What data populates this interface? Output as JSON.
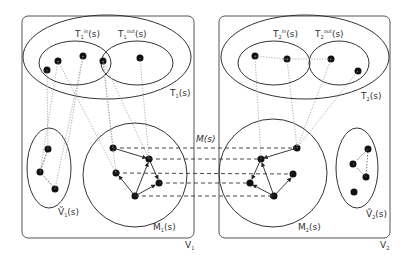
{
  "diagram": {
    "graphs": [
      {
        "id": "V1",
        "label": "V",
        "label_sub": "1",
        "regions": {
          "terminal": {
            "label": "T",
            "label_sub": "1",
            "label_suffix": "(s)"
          },
          "terminal_in": {
            "label": "T",
            "label_sub": "1",
            "label_sup": "in",
            "label_suffix": "(s)"
          },
          "terminal_out": {
            "label": "T",
            "label_sub": "1",
            "label_sup": "out",
            "label_suffix": "(s)"
          },
          "matched": {
            "label": "M",
            "label_sub": "1",
            "label_suffix": "(s)"
          },
          "remaining": {
            "label": "V",
            "label_sub": "1",
            "label_suffix": "(s)",
            "accent": "~"
          }
        }
      },
      {
        "id": "V2",
        "label": "V",
        "label_sub": "2",
        "regions": {
          "terminal": {
            "label": "T",
            "label_sub": "2",
            "label_suffix": "(s)"
          },
          "terminal_in": {
            "label": "T",
            "label_sub": "2",
            "label_sup": "in",
            "label_suffix": "(s)"
          },
          "terminal_out": {
            "label": "T",
            "label_sub": "2",
            "label_sup": "out",
            "label_suffix": "(s)"
          },
          "matched": {
            "label": "M",
            "label_sub": "2",
            "label_suffix": "(s)"
          },
          "remaining": {
            "label": "V",
            "label_sub": "2",
            "label_suffix": "(s)",
            "accent": "~"
          }
        }
      }
    ],
    "mapping_label": "M(s)",
    "colors": {
      "stroke": "#444444",
      "node": "#111111",
      "dotted": "#999999"
    }
  }
}
